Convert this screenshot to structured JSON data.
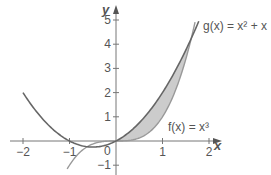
{
  "chart_data": {
    "type": "line",
    "title": "",
    "xlabel": "x",
    "ylabel": "y",
    "xlim": [
      -2.2,
      2.2
    ],
    "ylim": [
      -1.3,
      5.4
    ],
    "x_ticks": [
      -2,
      -1,
      1,
      2
    ],
    "x_tick_labels": [
      "−2",
      "−1",
      "1",
      "2"
    ],
    "y_ticks": [
      -1,
      1,
      2,
      3,
      4,
      5
    ],
    "y_tick_labels": [
      "−1",
      "1",
      "2",
      "3",
      "4",
      "5"
    ],
    "origin_label": "0",
    "grid": false,
    "series": [
      {
        "name": "g(x) = x² + x",
        "label_text": "g(x) = x² + x",
        "expression": "x^2 + x",
        "domain": [
          -2,
          1.78
        ],
        "x": [
          -2,
          -1.5,
          -1,
          -0.5,
          0,
          0.5,
          1,
          1.5,
          1.78
        ],
        "values": [
          2,
          0.75,
          0,
          -0.25,
          0,
          0.75,
          2,
          3.75,
          4.95
        ],
        "color": "#666666"
      },
      {
        "name": "f(x) = x³",
        "label_text": "f(x) = x³",
        "expression": "x^3",
        "domain": [
          -1.05,
          1.7
        ],
        "x": [
          -1,
          -0.5,
          0,
          0.5,
          1,
          1.5,
          1.7
        ],
        "values": [
          -1,
          -0.125,
          0,
          0.125,
          1,
          3.375,
          4.91
        ],
        "color": "#999999"
      }
    ],
    "shaded_region": {
      "between": [
        "g(x)",
        "f(x)"
      ],
      "x_range": [
        0,
        1.618
      ],
      "color": "#bbbbbb"
    }
  },
  "layout": {
    "origin_px": [
      116,
      141
    ],
    "px_per_unit_x": 46.5,
    "px_per_unit_y": 24.2
  }
}
